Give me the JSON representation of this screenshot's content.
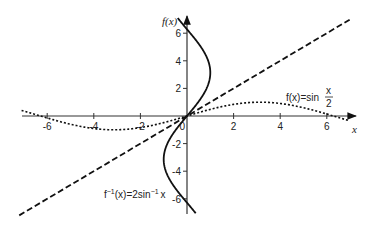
{
  "chart_data": {
    "type": "line",
    "title": "",
    "xlabel": "x",
    "ylabel": "f(x)",
    "xlim": [
      -7,
      7
    ],
    "ylim": [
      -7,
      7
    ],
    "grid": false,
    "x_ticks": [
      -6,
      -4,
      -2,
      2,
      4,
      6
    ],
    "y_ticks": [
      -6,
      -4,
      -2,
      2,
      4,
      6
    ],
    "x_tick_labels": [
      "-6",
      "-4",
      "-2",
      "2",
      "4",
      "6"
    ],
    "y_tick_labels": [
      "-6",
      "-4",
      "-2",
      "0",
      "2",
      "4",
      "6"
    ],
    "series": [
      {
        "name": "f(x) = sin x/2",
        "style": "dotted",
        "function": "sin(x/2)",
        "domain": [
          -7,
          7
        ],
        "x": [
          -6.28,
          -4.71,
          -3.14,
          -1.57,
          0,
          1.57,
          3.14,
          4.71,
          6.28
        ],
        "values": [
          0,
          -0.71,
          -1,
          -0.71,
          0,
          0.71,
          1,
          0.71,
          0
        ]
      },
      {
        "name": "f^-1(x) = 2 sin^-1 x",
        "style": "solid",
        "function": "2*asin(x)",
        "domain": [
          -1,
          1
        ],
        "x": [
          -1,
          -0.71,
          0,
          0.71,
          1
        ],
        "values": [
          -3.14,
          -1.57,
          0,
          1.57,
          3.14
        ],
        "note": "drawn as the full reflection x = sin(y/2) for y in [-2π, 2π]"
      },
      {
        "name": "y = x",
        "style": "dashed",
        "function": "x",
        "domain": [
          -7,
          7
        ],
        "x": [
          -7,
          7
        ],
        "values": [
          -7,
          7
        ]
      }
    ],
    "annotations": [
      {
        "text": "f(x) = sin x/2",
        "near": [
          4.5,
          1.5
        ]
      },
      {
        "text": "f⁻¹(x) = 2sin⁻¹ x",
        "near": [
          -2.5,
          -5.3
        ]
      }
    ]
  },
  "labels": {
    "y_axis": "f(x)",
    "x_axis": "x",
    "sin_label_prefix": "f(x)=sin",
    "sin_label_num": "x",
    "sin_label_den": "2",
    "inv_label_f": "f",
    "inv_label_sup1": "−1",
    "inv_label_mid": "(x)=2sin",
    "inv_label_sup2": "−1",
    "inv_label_x": "x",
    "tick_0": "0"
  }
}
